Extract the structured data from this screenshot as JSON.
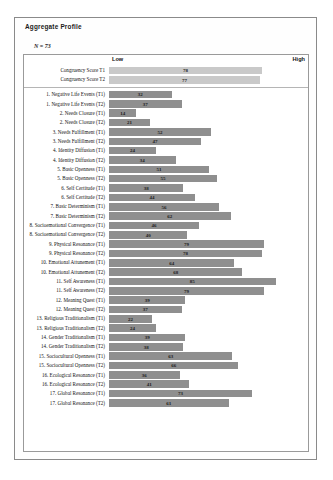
{
  "header": {
    "title": "Aggregate Profile",
    "sample_size": "N = 73"
  },
  "axis": {
    "low_label": "Low",
    "high_label": "High"
  },
  "chart_data": {
    "type": "bar",
    "orientation": "horizontal",
    "title": "Aggregate Profile",
    "xlabel": "",
    "ylabel": "",
    "xlim": [
      0,
      100
    ],
    "grid": false,
    "legend": "none",
    "axis_tick_labels": [
      "Low",
      "High"
    ],
    "annotations": [
      "N = 73"
    ],
    "groups": [
      {
        "name": "congruency",
        "style": "light",
        "categories": [
          "Congruency Score T1",
          "Congruency Score T2"
        ],
        "values": [
          78,
          77
        ]
      },
      {
        "name": "items",
        "style": "dark",
        "categories": [
          "1. Negative Life Events (T1)",
          "1. Negative Life Events (T2)",
          "2. Needs Closure (T1)",
          "2. Needs Closure (T2)",
          "3. Needs Fulfillment (T1)",
          "3. Needs Fulfillment (T2)",
          "4. Identity Diffusion (T1)",
          "4. Identity Diffusion (T2)",
          "5. Basic Openness (T1)",
          "5. Basic Openness (T2)",
          "6. Self Certitude (T1)",
          "6. Self Certitude (T2)",
          "7. Basic Determinism (T1)",
          "7. Basic Determinism (T2)",
          "8. Socioemotional Convergence (T1)",
          "8. Socioemotional Convergence (T2)",
          "9. Physical Resonance (T1)",
          "9. Physical Resonance (T2)",
          "10. Emotional Attunement (T1)",
          "10. Emotional Attunement (T2)",
          "11. Self Awareness (T1)",
          "11. Self Awareness (T2)",
          "12. Meaning Quest (T1)",
          "12. Meaning Quest (T2)",
          "13. Religious Traditionalism (T1)",
          "13. Religious Traditionalism (T2)",
          "14. Gender Traditionalism (T1)",
          "14. Gender Traditionalism (T2)",
          "15. Sociocultural Openness (T1)",
          "15. Sociocultural Openness (T2)",
          "16. Ecological Resonance (T1)",
          "16. Ecological Resonance (T2)",
          "17. Global Resonance (T1)",
          "17. Global Resonance (T2)"
        ],
        "values": [
          32,
          37,
          14,
          21,
          52,
          47,
          24,
          34,
          51,
          55,
          38,
          44,
          56,
          62,
          46,
          40,
          79,
          78,
          64,
          68,
          85,
          79,
          39,
          37,
          22,
          24,
          39,
          38,
          63,
          66,
          36,
          41,
          73,
          61
        ]
      }
    ],
    "colors": {
      "bar_dark": "#8f8f8f",
      "bar_light": "#c9c9c9",
      "border": "#9a9a9a",
      "text": "#131313"
    }
  }
}
